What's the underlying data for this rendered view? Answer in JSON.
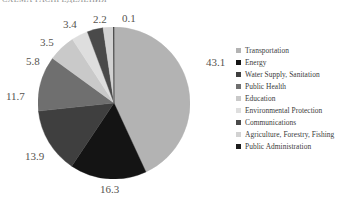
{
  "page": {
    "title_sliver": "СХЕМА РАСПРЕДЕЛЕНИЯ"
  },
  "chart_data": {
    "type": "pie",
    "title": "",
    "xlabel": "",
    "ylabel": "",
    "legend_position": "right",
    "grid": false,
    "units": "percent",
    "categories": [
      "Transportation",
      "Energy",
      "Water Supply, Sanitation",
      "Public Health",
      "Education",
      "Environmental Protection",
      "Communications",
      "Agriculture, Forestry, Fishing",
      "Public Administration"
    ],
    "values": [
      43.1,
      16.3,
      13.9,
      11.7,
      5.8,
      3.5,
      3.4,
      2.2,
      0.1
    ],
    "colors": [
      "#b3b3b3",
      "#141414",
      "#3f3f3f",
      "#6f6f6f",
      "#c9c9c9",
      "#dedede",
      "#4a4a4a",
      "#d2d2d2",
      "#1c1c1c"
    ],
    "data_labels": [
      "43.1",
      "16.3",
      "13.9",
      "11.7",
      "5.8",
      "3.5",
      "3.4",
      "2.2",
      "0.1"
    ],
    "start_angle_deg": 0,
    "direction": "clockwise"
  },
  "labels_layout": [
    {
      "text": "43.1",
      "left": 206,
      "top": 57
    },
    {
      "text": "16.3",
      "left": 100,
      "top": 184
    },
    {
      "text": "13.9",
      "left": 25,
      "top": 151
    },
    {
      "text": "11.7",
      "left": 6,
      "top": 91
    },
    {
      "text": "5.8",
      "left": 26,
      "top": 56
    },
    {
      "text": "3.5",
      "left": 40,
      "top": 37
    },
    {
      "text": "3.4",
      "left": 63,
      "top": 19
    },
    {
      "text": "2.2",
      "left": 93,
      "top": 14
    },
    {
      "text": "0.1",
      "left": 122,
      "top": 13
    }
  ]
}
